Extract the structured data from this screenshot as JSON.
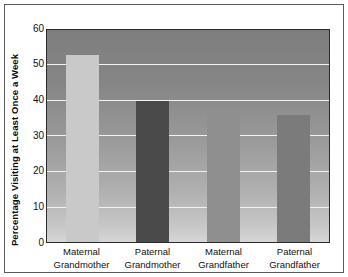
{
  "chart_data": {
    "type": "bar",
    "title": "",
    "xlabel": "",
    "ylabel": "Percentage Visiting at Least Once a Week",
    "ylim": [
      0,
      60
    ],
    "yticks": [
      0,
      10,
      20,
      30,
      40,
      50,
      60
    ],
    "ytick_labels": [
      "0",
      "10",
      "20",
      "30",
      "40",
      "50",
      "60"
    ],
    "grid": true,
    "legend": false,
    "categories": [
      "Maternal Grandmother",
      "Paternal Grandmother",
      "Maternal Grandfather",
      "Paternal Grandfather"
    ],
    "category_lines": [
      [
        "Maternal",
        "Grandmother"
      ],
      [
        "Paternal",
        "Grandmother"
      ],
      [
        "Maternal",
        "Grandfather"
      ],
      [
        "Paternal",
        "Grandfather"
      ]
    ],
    "values": [
      53,
      40,
      38,
      36
    ],
    "bar_colors": [
      "#c9c9c9",
      "#4a4a4a",
      "#8f8f8f",
      "#7b7b7b"
    ],
    "plot_background": {
      "gradient_top": "#7e7e7e",
      "gradient_bottom": "#d6d6d6",
      "gridline_color": "#f2f2f2",
      "border_color": "#2b2b2b"
    },
    "frame_color": "#5a5a5a"
  }
}
